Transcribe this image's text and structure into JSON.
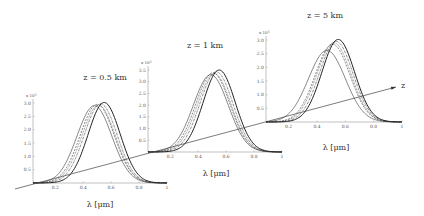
{
  "chart_data": {
    "type": "line",
    "title": "",
    "z_axis": {
      "label": "z",
      "start": [
        15,
        189
      ],
      "end": [
        396,
        87
      ]
    },
    "panels": [
      {
        "title": "z = 0.5 km",
        "xlabel": "λ [μm]",
        "ylabel_scale": "x 10^5",
        "xlim": [
          0.04,
          1.0
        ],
        "ylim": [
          0,
          3.0
        ],
        "xticks": [
          0.2,
          0.4,
          0.6,
          0.8,
          1
        ],
        "xtick_labels": [
          "0.2",
          "0.4",
          "0.6",
          "0.8",
          "1"
        ],
        "yticks": [
          0.5,
          1.0,
          1.5,
          2.0,
          2.5,
          3.0
        ],
        "ytick_labels": [
          "0.5",
          "1.0",
          "1.5",
          "2.0",
          "2.5",
          "3.0"
        ],
        "box": {
          "x0": 33,
          "x1": 167,
          "y0": 183,
          "ytop": 103
        },
        "title_pos": [
          105,
          80
        ],
        "xlabel_pos": [
          100,
          207
        ],
        "series": [
          {
            "name": "curve-1",
            "center": 0.48,
            "amp": 2.9,
            "sigma": 0.125,
            "style": "solid-thin"
          },
          {
            "name": "curve-2",
            "center": 0.5,
            "amp": 2.95,
            "sigma": 0.122,
            "style": "dashed"
          },
          {
            "name": "curve-3",
            "center": 0.51,
            "amp": 2.92,
            "sigma": 0.12,
            "style": "dotted"
          },
          {
            "name": "curve-4",
            "center": 0.525,
            "amp": 2.97,
            "sigma": 0.118,
            "style": "dashdot"
          },
          {
            "name": "curve-5",
            "center": 0.55,
            "amp": 3.02,
            "sigma": 0.115,
            "style": "solid-thick"
          }
        ]
      },
      {
        "title": "z = 1 km",
        "xlabel": "λ [μm]",
        "ylabel_scale": "x 10^5",
        "xlim": [
          0.04,
          1.0
        ],
        "ylim": [
          0,
          3.5
        ],
        "xticks": [
          0.2,
          0.4,
          0.6,
          0.8,
          1
        ],
        "xtick_labels": [
          "0.2",
          "0.4",
          "0.6",
          "0.8",
          "1"
        ],
        "yticks": [
          0.5,
          1.0,
          1.5,
          2.0,
          2.5,
          3.0,
          3.5
        ],
        "ytick_labels": [
          "0.5",
          "1.0",
          "1.5",
          "2.0",
          "2.5",
          "3.0",
          "3.5"
        ],
        "box": {
          "x0": 148,
          "x1": 282,
          "y0": 152,
          "ytop": 70
        },
        "title_pos": [
          205,
          48
        ],
        "xlabel_pos": [
          216,
          176
        ],
        "series": [
          {
            "name": "curve-1",
            "center": 0.49,
            "amp": 3.3,
            "sigma": 0.125,
            "style": "solid-thin"
          },
          {
            "name": "curve-2",
            "center": 0.505,
            "amp": 3.38,
            "sigma": 0.122,
            "style": "dashed"
          },
          {
            "name": "curve-3",
            "center": 0.515,
            "amp": 3.35,
            "sigma": 0.12,
            "style": "dotted"
          },
          {
            "name": "curve-4",
            "center": 0.53,
            "amp": 3.42,
            "sigma": 0.118,
            "style": "dashdot"
          },
          {
            "name": "curve-5",
            "center": 0.55,
            "amp": 3.5,
            "sigma": 0.115,
            "style": "solid-thick"
          }
        ]
      },
      {
        "title": "z = 5 km",
        "xlabel": "λ [μm]",
        "ylabel_scale": "x 10^5",
        "xlim": [
          0.04,
          1.0
        ],
        "ylim": [
          0,
          3.0
        ],
        "xticks": [
          0.2,
          0.4,
          0.6,
          0.8,
          1
        ],
        "xtick_labels": [
          "0.2",
          "0.4",
          "0.6",
          "0.8",
          "1"
        ],
        "yticks": [
          0.5,
          1.0,
          1.5,
          2.0,
          2.5,
          3.0
        ],
        "ytick_labels": [
          "0.5",
          "1.0",
          "1.5",
          "2.0",
          "2.5",
          "3.0"
        ],
        "box": {
          "x0": 266,
          "x1": 402,
          "y0": 122,
          "ytop": 40
        },
        "title_pos": [
          325,
          18
        ],
        "xlabel_pos": [
          336,
          150
        ],
        "series": [
          {
            "name": "curve-1",
            "center": 0.47,
            "amp": 2.62,
            "sigma": 0.13,
            "style": "solid-thin"
          },
          {
            "name": "curve-2",
            "center": 0.51,
            "amp": 2.85,
            "sigma": 0.122,
            "style": "dashed"
          },
          {
            "name": "curve-3",
            "center": 0.52,
            "amp": 2.9,
            "sigma": 0.12,
            "style": "dotted"
          },
          {
            "name": "curve-4",
            "center": 0.535,
            "amp": 2.95,
            "sigma": 0.118,
            "style": "dashdot"
          },
          {
            "name": "curve-5",
            "center": 0.55,
            "amp": 3.02,
            "sigma": 0.115,
            "style": "solid-thick"
          }
        ]
      }
    ],
    "grid": false,
    "legend": null
  }
}
